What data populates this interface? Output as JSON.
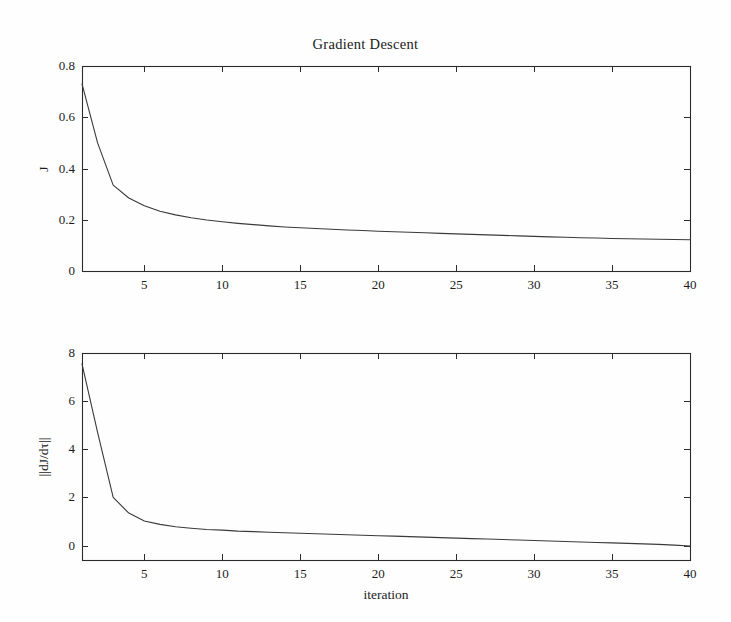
{
  "figure": {
    "title": "Gradient Descent",
    "background_color": "#fefefe",
    "line_color": "#3a3a3a",
    "axis_color": "#2b2b2b"
  },
  "chart_data": [
    {
      "type": "line",
      "title": "Gradient Descent",
      "panel": "top",
      "xlabel": "",
      "ylabel": "J",
      "xlim": [
        1,
        40
      ],
      "ylim": [
        0,
        0.8
      ],
      "grid": false,
      "legend": null,
      "xticks": [
        5,
        10,
        15,
        20,
        25,
        30,
        35,
        40
      ],
      "xtick_labels": [
        "5",
        "10",
        "15",
        "20",
        "25",
        "30",
        "35",
        "40"
      ],
      "yticks": [
        0,
        0.2,
        0.4,
        0.6,
        0.8
      ],
      "ytick_labels": [
        "0",
        "0.2",
        "0.4",
        "0.6",
        "0.8"
      ],
      "x": [
        1,
        2,
        3,
        4,
        5,
        6,
        7,
        8,
        9,
        10,
        11,
        12,
        13,
        14,
        15,
        16,
        17,
        18,
        19,
        20,
        21,
        22,
        23,
        24,
        25,
        26,
        27,
        28,
        29,
        30,
        31,
        32,
        33,
        34,
        35,
        36,
        37,
        38,
        39,
        40
      ],
      "y": [
        0.73,
        0.5,
        0.335,
        0.285,
        0.255,
        0.233,
        0.219,
        0.208,
        0.199,
        0.192,
        0.186,
        0.181,
        0.176,
        0.172,
        0.169,
        0.166,
        0.163,
        0.16,
        0.158,
        0.155,
        0.153,
        0.151,
        0.149,
        0.147,
        0.145,
        0.143,
        0.141,
        0.139,
        0.137,
        0.135,
        0.133,
        0.132,
        0.13,
        0.129,
        0.127,
        0.126,
        0.125,
        0.124,
        0.123,
        0.122
      ]
    },
    {
      "type": "line",
      "panel": "bottom",
      "xlabel": "iteration",
      "ylabel": "||dJ/dτ||",
      "xlim": [
        1,
        40
      ],
      "ylim": [
        -0.6,
        8
      ],
      "grid": false,
      "legend": null,
      "xticks": [
        5,
        10,
        15,
        20,
        25,
        30,
        35,
        40
      ],
      "xtick_labels": [
        "5",
        "10",
        "15",
        "20",
        "25",
        "30",
        "35",
        "40"
      ],
      "yticks": [
        0,
        2,
        4,
        6,
        8
      ],
      "ytick_labels": [
        "0",
        "2",
        "4",
        "6",
        "8"
      ],
      "x": [
        1,
        2,
        3,
        4,
        5,
        6,
        7,
        8,
        9,
        10,
        11,
        12,
        13,
        14,
        15,
        16,
        17,
        18,
        19,
        20,
        21,
        22,
        23,
        24,
        25,
        26,
        27,
        28,
        29,
        30,
        31,
        32,
        33,
        34,
        35,
        36,
        37,
        38,
        39,
        40
      ],
      "y": [
        7.55,
        4.7,
        2.0,
        1.35,
        1.02,
        0.88,
        0.78,
        0.72,
        0.67,
        0.64,
        0.6,
        0.58,
        0.55,
        0.53,
        0.51,
        0.49,
        0.47,
        0.45,
        0.43,
        0.41,
        0.39,
        0.37,
        0.35,
        0.33,
        0.31,
        0.29,
        0.27,
        0.25,
        0.23,
        0.21,
        0.19,
        0.17,
        0.15,
        0.13,
        0.11,
        0.09,
        0.07,
        0.05,
        0.02,
        -0.02
      ]
    }
  ]
}
